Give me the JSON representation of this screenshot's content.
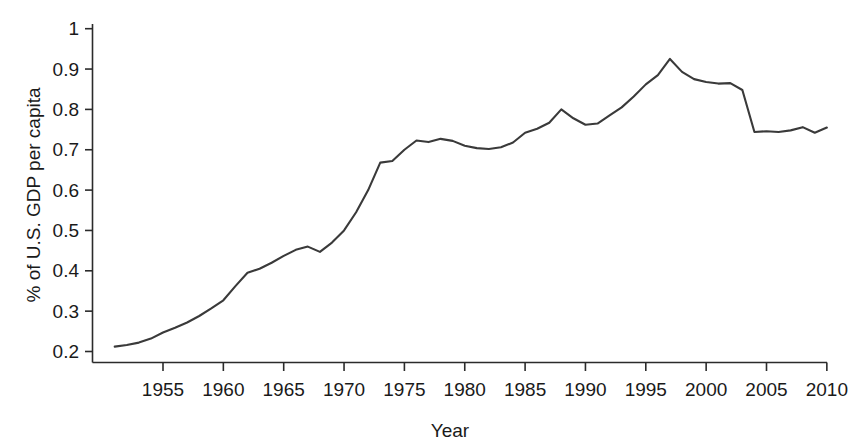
{
  "chart_data": {
    "type": "line",
    "title": "",
    "xlabel": "Year",
    "ylabel": "% of U.S. GDP per capita",
    "xlim": [
      1951,
      2010
    ],
    "ylim": [
      0.2,
      1.0
    ],
    "grid": false,
    "legend": "none",
    "line_color": "#3a3a3a",
    "x_ticks": [
      1955,
      1960,
      1965,
      1970,
      1975,
      1980,
      1985,
      1990,
      1995,
      2000,
      2005,
      2010
    ],
    "x_tick_labels": [
      "1955",
      "1960",
      "1965",
      "1970",
      "1975",
      "1980",
      "1985",
      "1990",
      "1995",
      "2000",
      "2005",
      "2010"
    ],
    "y_ticks": [
      0.2,
      0.3,
      0.4,
      0.5,
      0.6,
      0.7,
      0.8,
      0.9,
      1.0
    ],
    "y_tick_labels": [
      "0.2",
      "0.3",
      "0.4",
      "0.5",
      "0.6",
      "0.7",
      "0.8",
      "0.9",
      "1"
    ],
    "x": [
      1951,
      1952,
      1953,
      1954,
      1955,
      1956,
      1957,
      1958,
      1959,
      1960,
      1961,
      1962,
      1963,
      1964,
      1965,
      1966,
      1967,
      1968,
      1969,
      1970,
      1971,
      1972,
      1973,
      1974,
      1975,
      1976,
      1977,
      1978,
      1979,
      1980,
      1981,
      1982,
      1983,
      1984,
      1985,
      1986,
      1987,
      1988,
      1989,
      1990,
      1991,
      1992,
      1993,
      1994,
      1995,
      1996,
      1997,
      1998,
      1999,
      2000,
      2001,
      2002,
      2003,
      2004,
      2005,
      2006,
      2007,
      2008,
      2009,
      2010
    ],
    "values": [
      0.212,
      0.216,
      0.222,
      0.232,
      0.247,
      0.259,
      0.272,
      0.288,
      0.307,
      0.327,
      0.362,
      0.395,
      0.405,
      0.42,
      0.437,
      0.452,
      0.46,
      0.447,
      0.47,
      0.5,
      0.545,
      0.6,
      0.668,
      0.672,
      0.7,
      0.723,
      0.719,
      0.727,
      0.722,
      0.71,
      0.704,
      0.702,
      0.706,
      0.718,
      0.742,
      0.752,
      0.767,
      0.8,
      0.778,
      0.762,
      0.765,
      0.785,
      0.805,
      0.832,
      0.862,
      0.885,
      0.925,
      0.893,
      0.875,
      0.868,
      0.864,
      0.865,
      0.848,
      0.812,
      0.77,
      0.752,
      0.748,
      0.745,
      0.743,
      0.742
    ],
    "values_tail": [
      0.744,
      0.746,
      0.744,
      0.748,
      0.756,
      0.742,
      0.755
    ],
    "series_name": "% of U.S. GDP per capita",
    "peak": {
      "year": 1991,
      "value": 0.925
    },
    "start": {
      "year": 1951,
      "value": 0.212
    },
    "end": {
      "year": 2010,
      "value": 0.755
    }
  }
}
